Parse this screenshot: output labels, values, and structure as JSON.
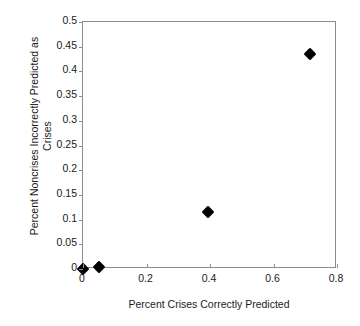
{
  "chart_data": {
    "type": "scatter",
    "title": "",
    "xlabel": "Percent Crises Correctly Predicted",
    "ylabel": "Percent Noncrises Incorrectly Predicted as Crises",
    "ylabel_lines": [
      "Percent Noncrises Incorrectly Predicted as",
      "Crises"
    ],
    "xlim": [
      0,
      0.8
    ],
    "ylim": [
      0,
      0.5
    ],
    "xticks": [
      0,
      0.2,
      0.4,
      0.6,
      0.8
    ],
    "xtick_labels": [
      "0",
      "0.2",
      "0.4",
      "0.6",
      "0.8"
    ],
    "yticks": [
      0,
      0.05,
      0.1,
      0.15,
      0.2,
      0.25,
      0.3,
      0.35,
      0.4,
      0.45,
      0.5
    ],
    "ytick_labels": [
      "0",
      "0.05",
      "0.1",
      "0.15",
      "0.2",
      "0.25",
      "0.3",
      "0.35",
      "0.4",
      "0.45",
      "0.5"
    ],
    "grid": false,
    "legend": false,
    "marker": "diamond",
    "marker_color": "#000000",
    "points": [
      {
        "x": 0.0,
        "y": 0.0
      },
      {
        "x": 0.05,
        "y": 0.005
      },
      {
        "x": 0.395,
        "y": 0.115
      },
      {
        "x": 0.715,
        "y": 0.435
      }
    ]
  },
  "colors": {
    "axis": "#8d8d8d",
    "text": "#1a1a1a",
    "marker": "#000000",
    "background": "#ffffff"
  }
}
